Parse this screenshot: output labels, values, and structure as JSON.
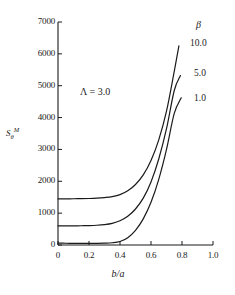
{
  "chart_data": {
    "type": "line",
    "title": "",
    "xlabel": "b/a",
    "ylabel": "S_θ^M",
    "xlim": [
      0,
      1.0
    ],
    "ylim": [
      0,
      7000
    ],
    "grid": false,
    "legend_position": "upper-right-inside",
    "legend_title": "β",
    "annotations": [
      {
        "text": "Λ = 3.0",
        "x": 0.28,
        "y": 5050
      }
    ],
    "xticks": [
      "0",
      "0.2",
      "0.4",
      "0.6",
      "0.8",
      "1.0"
    ],
    "xtick_values": [
      0,
      0.2,
      0.4,
      0.6,
      0.8,
      1.0
    ],
    "yticks": [
      "0",
      "1000",
      "2000",
      "3000",
      "4000",
      "5000",
      "6000",
      "7000"
    ],
    "ytick_values": [
      0,
      1000,
      2000,
      3000,
      4000,
      5000,
      6000,
      7000
    ],
    "series": [
      {
        "name": "10.0",
        "label": "10.0",
        "color": "#1a1a1a",
        "x": [
          0.0,
          0.05,
          0.1,
          0.15,
          0.2,
          0.25,
          0.3,
          0.35,
          0.4,
          0.45,
          0.5,
          0.55,
          0.6,
          0.65,
          0.7,
          0.75,
          0.78
        ],
        "values": [
          1450,
          1450,
          1452,
          1455,
          1460,
          1470,
          1490,
          1520,
          1580,
          1700,
          1900,
          2200,
          2650,
          3300,
          4200,
          5450,
          6250
        ]
      },
      {
        "name": "5.0",
        "label": "5.0",
        "color": "#1a1a1a",
        "x": [
          0.0,
          0.05,
          0.1,
          0.15,
          0.2,
          0.25,
          0.3,
          0.35,
          0.4,
          0.45,
          0.5,
          0.55,
          0.6,
          0.65,
          0.7,
          0.75,
          0.79
        ],
        "values": [
          600,
          600,
          602,
          605,
          610,
          620,
          640,
          680,
          760,
          900,
          1130,
          1470,
          1980,
          2700,
          3650,
          4850,
          5320
        ]
      },
      {
        "name": "1.0",
        "label": "1.0",
        "color": "#1a1a1a",
        "x": [
          0.0,
          0.05,
          0.1,
          0.15,
          0.2,
          0.25,
          0.3,
          0.35,
          0.4,
          0.45,
          0.5,
          0.55,
          0.6,
          0.65,
          0.7,
          0.75,
          0.795
        ],
        "values": [
          60,
          55,
          52,
          50,
          50,
          52,
          58,
          70,
          110,
          230,
          460,
          820,
          1340,
          2060,
          3000,
          4130,
          4620
        ]
      }
    ]
  },
  "axis": {
    "y_label_base": "S",
    "y_label_sub": "θ",
    "y_label_sup": "M",
    "x_label": "b/a"
  },
  "legend": {
    "title": "β",
    "entries": [
      "10.0",
      "5.0",
      "1.0"
    ]
  },
  "annotation": {
    "lambda_text": "Λ = 3.0"
  },
  "colors": {
    "line": "#1a1a1a",
    "axis": "#1a1a1a",
    "background": "#ffffff"
  }
}
